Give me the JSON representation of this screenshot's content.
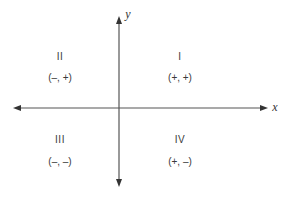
{
  "diagram": {
    "type": "cartesian-coordinate-plane",
    "axes": {
      "x": {
        "label": "x"
      },
      "y": {
        "label": "y"
      }
    },
    "quadrants": [
      {
        "id": "I",
        "numeral": "I",
        "signs": "(+, +)"
      },
      {
        "id": "II",
        "numeral": "II",
        "signs": "(–, +)"
      },
      {
        "id": "III",
        "numeral": "III",
        "signs": "(–, –)"
      },
      {
        "id": "IV",
        "numeral": "IV",
        "signs": "(+, –)"
      }
    ],
    "colors": {
      "axis": "#555555",
      "text": "#3a3a3a",
      "background": "#ffffff"
    }
  }
}
